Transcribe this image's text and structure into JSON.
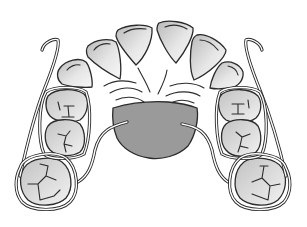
{
  "figure": {
    "colors": {
      "background": "#ffffff",
      "outline": "#2b2b2b",
      "plate_fill": "#9a9a9a",
      "tooth_light": "#f4f4f4",
      "tooth_dark": "#b8b8b8"
    },
    "components": {
      "anterior_teeth_count": 6,
      "premolars_per_side": 2,
      "molars_per_side": 1,
      "clasps": [
        "left-hook-clasp",
        "right-hook-clasp",
        "left-molar-band",
        "right-molar-band"
      ],
      "plate": "palatal-acrylic-plate"
    }
  }
}
